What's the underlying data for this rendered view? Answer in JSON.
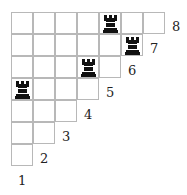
{
  "diagram": {
    "type": "staircase-board",
    "cell_size": 22,
    "rows": [
      {
        "label": "8",
        "cells": 7,
        "rooks": [
          4
        ]
      },
      {
        "label": "7",
        "cells": 6,
        "rooks": [
          5
        ]
      },
      {
        "label": "6",
        "cells": 5,
        "rooks": [
          3
        ]
      },
      {
        "label": "5",
        "cells": 4,
        "rooks": [
          0
        ]
      },
      {
        "label": "4",
        "cells": 3,
        "rooks": []
      },
      {
        "label": "3",
        "cells": 2,
        "rooks": []
      },
      {
        "label": "2",
        "cells": 1,
        "rooks": []
      },
      {
        "label": "1",
        "cells": 0,
        "rooks": []
      }
    ],
    "piece_icon": "rook-icon",
    "colors": {
      "grid": "#b8b8b8",
      "piece": "#111111",
      "text": "#222222"
    }
  }
}
